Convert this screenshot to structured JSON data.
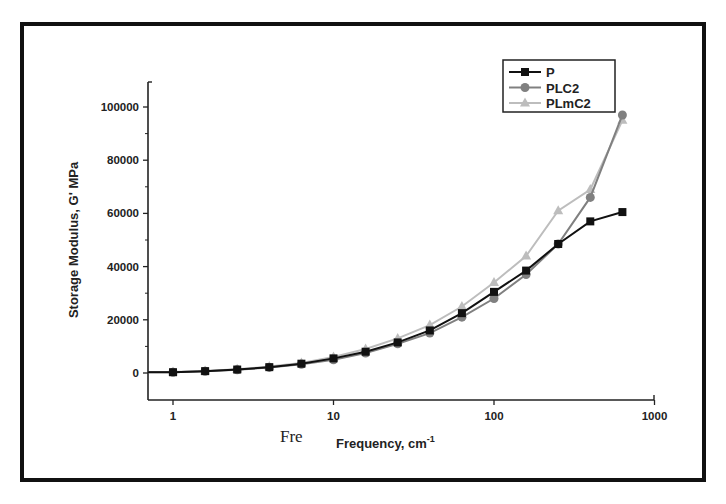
{
  "chart_data": {
    "type": "line",
    "title": "",
    "xlabel": "Frequency, cm-1",
    "xlabel_main": "Frequency, cm",
    "xlabel_sup": "-1",
    "ylabel": "Storage Modulus, G' MPa",
    "xscale": "log",
    "xlim": [
      0.7,
      1000
    ],
    "ylim": [
      -10000,
      110000
    ],
    "x_ticks": [
      "1",
      "10",
      "100",
      "1000"
    ],
    "y_ticks": [
      "0",
      "20000",
      "40000",
      "60000",
      "80000",
      "100000"
    ],
    "grid": false,
    "legend_position": "top-right",
    "stray_text": "Fre",
    "x": [
      1,
      1.585,
      2.512,
      3.981,
      6.31,
      10,
      15.85,
      25.12,
      39.81,
      63.1,
      100,
      158.5,
      251.2,
      398.1,
      631
    ],
    "series": [
      {
        "name": "P",
        "marker": "square",
        "color": "#111111",
        "values": [
          300,
          700,
          1300,
          2200,
          3500,
          5500,
          8000,
          11500,
          16000,
          22500,
          30500,
          38500,
          48500,
          57000,
          60500
        ]
      },
      {
        "name": "PLC2",
        "marker": "circle",
        "color": "#808080",
        "values": [
          300,
          650,
          1200,
          2100,
          3300,
          5000,
          7500,
          11000,
          15000,
          21000,
          28000,
          37000,
          48500,
          66000,
          97000
        ]
      },
      {
        "name": "PLmC2",
        "marker": "triangle",
        "color": "#bdbdbd",
        "values": [
          350,
          750,
          1400,
          2400,
          3800,
          6000,
          9000,
          13000,
          18000,
          25000,
          34000,
          44000,
          61000,
          69000,
          95000
        ]
      }
    ]
  }
}
